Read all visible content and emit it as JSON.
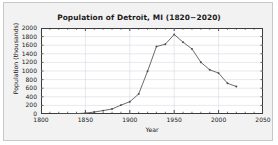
{
  "figure": {
    "background_color": "#f2f2f2",
    "border_color": "#c8c8c8",
    "plot_background_color": "#ffffff",
    "axis_color": "#3c3c3c",
    "grid_color": "#d9d9e0",
    "line_color": "#5a5a5a",
    "marker_color": "#4a4a4a"
  },
  "chart_data": {
    "type": "line",
    "title": "Population of Detroit, MI (1820−2020)",
    "xlabel": "Year",
    "ylabel": "Population (thousands)",
    "xlim": [
      1800,
      2050
    ],
    "ylim": [
      0,
      2000
    ],
    "xticks": [
      1800,
      1850,
      1900,
      1950,
      2000,
      2050
    ],
    "xtick_labels": [
      "1800",
      "1850",
      "1900",
      "1950",
      "2000",
      "2050"
    ],
    "xminor_step": 10,
    "yticks": [
      0,
      200,
      400,
      600,
      800,
      1000,
      1200,
      1400,
      1600,
      1800,
      2000
    ],
    "ytick_labels": [
      "0",
      "200",
      "400",
      "600",
      "800",
      "1000",
      "1200",
      "1400",
      "1600",
      "1800",
      "2000"
    ],
    "grid": true,
    "legend": false,
    "marker": "dot",
    "x": [
      1820,
      1830,
      1840,
      1850,
      1860,
      1870,
      1880,
      1890,
      1900,
      1910,
      1920,
      1930,
      1940,
      1950,
      1960,
      1970,
      1980,
      1990,
      2000,
      2010,
      2020
    ],
    "values": [
      1.4,
      2.2,
      9.1,
      21.0,
      45.6,
      79.6,
      116.3,
      205.9,
      285.7,
      465.8,
      993.7,
      1568.7,
      1623.5,
      1849.6,
      1670.1,
      1514.0,
      1203.3,
      1027.9,
      951.3,
      713.8,
      639.1
    ],
    "series": [
      {
        "name": "Population (thousands)",
        "values": [
          1.4,
          2.2,
          9.1,
          21.0,
          45.6,
          79.6,
          116.3,
          205.9,
          285.7,
          465.8,
          993.7,
          1568.7,
          1623.5,
          1849.6,
          1670.1,
          1514.0,
          1203.3,
          1027.9,
          951.3,
          713.8,
          639.1
        ]
      }
    ]
  }
}
